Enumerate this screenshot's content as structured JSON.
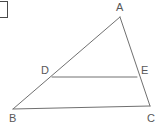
{
  "figure": {
    "kind": "geometry-diagram",
    "background_color": "#ffffff",
    "stroke_color": "#707070",
    "label_color": "#585858",
    "stroke_width": 1,
    "canvas": {
      "width": 164,
      "height": 129
    }
  },
  "corner_mark": {
    "name": "partial-rectangle-outline",
    "left": -3,
    "top": 1,
    "width": 11,
    "height": 17,
    "border_color": "#4a4a4a"
  },
  "points": [
    {
      "id": "A",
      "label": "A",
      "x": 120,
      "y": 17,
      "label_x": 116,
      "label_y": 2
    },
    {
      "id": "B",
      "label": "B",
      "x": 13,
      "y": 109,
      "label_x": 9,
      "label_y": 113
    },
    {
      "id": "C",
      "label": "C",
      "x": 150,
      "y": 106,
      "label_x": 147,
      "label_y": 113
    },
    {
      "id": "D",
      "label": "D",
      "x": 52,
      "y": 77,
      "label_x": 41,
      "label_y": 65
    },
    {
      "id": "E",
      "label": "E",
      "x": 137,
      "y": 77,
      "label_x": 141,
      "label_y": 65
    }
  ],
  "segments": [
    {
      "id": "AB",
      "name": "segment-ab",
      "x1": 120,
      "y1": 17,
      "x2": 13,
      "y2": 109
    },
    {
      "id": "AC",
      "name": "segment-ac",
      "x1": 120,
      "y1": 17,
      "x2": 150,
      "y2": 106
    },
    {
      "id": "BC",
      "name": "segment-bc",
      "x1": 13,
      "y1": 109,
      "x2": 150,
      "y2": 106
    },
    {
      "id": "DE",
      "name": "segment-de",
      "x1": 52,
      "y1": 77,
      "x2": 137,
      "y2": 77
    }
  ],
  "labels": {
    "A": "A",
    "B": "B",
    "C": "C",
    "D": "D",
    "E": "E"
  }
}
